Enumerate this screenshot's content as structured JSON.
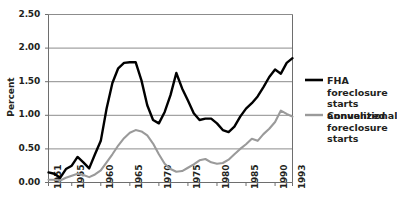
{
  "chart_data": {
    "type": "line",
    "title": "",
    "xlabel": "",
    "ylabel": "Percent",
    "xlim": [
      1951,
      1993
    ],
    "ylim": [
      0.0,
      2.5
    ],
    "grid": "horizontal",
    "legend_position": "right",
    "ytick_labels": [
      "0.00",
      "0.50",
      "1.00",
      "1.50",
      "2.00",
      "2.50"
    ],
    "ytick_values": [
      0.0,
      0.5,
      1.0,
      1.5,
      2.0,
      2.5
    ],
    "xtick_labels": [
      "1951",
      "1955",
      "1960",
      "1965",
      "1970",
      "1975",
      "1980",
      "1985",
      "1990",
      "1993"
    ],
    "xtick_values": [
      1951,
      1955,
      1960,
      1965,
      1970,
      1975,
      1980,
      1985,
      1990,
      1993
    ],
    "series": [
      {
        "name": "FHA foreclosure starts annualized",
        "color": "#000000",
        "x": [
          1951,
          1952,
          1953,
          1954,
          1955,
          1956,
          1957,
          1958,
          1959,
          1960,
          1961,
          1962,
          1963,
          1964,
          1965,
          1966,
          1967,
          1968,
          1969,
          1970,
          1971,
          1972,
          1973,
          1974,
          1975,
          1976,
          1977,
          1978,
          1979,
          1980,
          1981,
          1982,
          1983,
          1984,
          1985,
          1986,
          1987,
          1988,
          1989,
          1990,
          1991,
          1992,
          1993
        ],
        "values": [
          0.15,
          0.13,
          0.07,
          0.2,
          0.25,
          0.38,
          0.3,
          0.21,
          0.42,
          0.62,
          1.1,
          1.48,
          1.7,
          1.78,
          1.79,
          1.79,
          1.52,
          1.15,
          0.93,
          0.88,
          1.05,
          1.3,
          1.63,
          1.4,
          1.22,
          1.03,
          0.93,
          0.95,
          0.95,
          0.88,
          0.78,
          0.75,
          0.83,
          0.98,
          1.1,
          1.18,
          1.28,
          1.42,
          1.57,
          1.68,
          1.62,
          1.78,
          1.85
        ]
      },
      {
        "name": "Conventional foreclosure starts",
        "color": "#9a9a9a",
        "x": [
          1951,
          1952,
          1953,
          1954,
          1955,
          1956,
          1957,
          1958,
          1959,
          1960,
          1961,
          1962,
          1963,
          1964,
          1965,
          1966,
          1967,
          1968,
          1969,
          1970,
          1971,
          1972,
          1973,
          1974,
          1975,
          1976,
          1977,
          1978,
          1979,
          1980,
          1981,
          1982,
          1983,
          1984,
          1985,
          1986,
          1987,
          1988,
          1989,
          1990,
          1991,
          1992,
          1993
        ],
        "values": [
          0.04,
          0.04,
          0.03,
          0.07,
          0.1,
          0.13,
          0.11,
          0.08,
          0.12,
          0.18,
          0.3,
          0.42,
          0.55,
          0.66,
          0.74,
          0.78,
          0.76,
          0.7,
          0.58,
          0.42,
          0.28,
          0.2,
          0.16,
          0.17,
          0.22,
          0.27,
          0.33,
          0.35,
          0.3,
          0.28,
          0.29,
          0.34,
          0.42,
          0.5,
          0.57,
          0.65,
          0.62,
          0.72,
          0.8,
          0.9,
          1.07,
          1.02,
          0.98
        ]
      }
    ]
  },
  "legend": {
    "entries": [
      {
        "label": "FHA foreclosure\nstarts annualized",
        "swatch": "black-line-swatch"
      },
      {
        "label": "Conventional\nforeclosure starts",
        "swatch": "gray-line-swatch"
      }
    ]
  },
  "colors": {
    "fha_line": "#000000",
    "conventional_line": "#9a9a9a",
    "gridline": "#8c8c8c",
    "axis": "#6e6e6e",
    "text": "#231f20",
    "background": "#ffffff"
  }
}
